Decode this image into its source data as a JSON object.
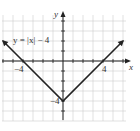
{
  "chart_data": {
    "type": "line",
    "title": "",
    "equation_label": "y = |x| − 4",
    "xlabel": "x",
    "ylabel": "y",
    "xlim": [
      -6,
      6
    ],
    "ylim": [
      -6,
      4.5
    ],
    "grid": true,
    "x_tick_labels": [
      {
        "value": -4,
        "label": "−4"
      },
      {
        "value": 4,
        "label": "4"
      }
    ],
    "y_tick_labels": [
      {
        "value": -4,
        "label": "−4"
      }
    ],
    "series": [
      {
        "name": "y = |x| − 4",
        "x": [
          -6,
          -4,
          0,
          4,
          6
        ],
        "values": [
          2,
          0,
          -4,
          0,
          2
        ],
        "arrows_at_ends": true
      }
    ],
    "colors": {
      "line": "#222222",
      "grid": "#cccccc",
      "axis": "#222222"
    }
  }
}
